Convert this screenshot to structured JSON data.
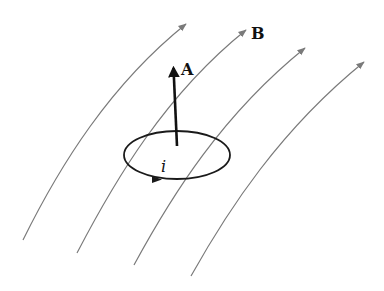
{
  "diagram": {
    "labels": {
      "field": "B",
      "area_vector": "A",
      "current": "i"
    },
    "colors": {
      "field_lines": "#7a7a7a",
      "loop": "#1a1a1a",
      "vector": "#111111",
      "background": "#ffffff"
    },
    "field_lines": [
      {
        "id": 1,
        "start": [
          23,
          240
        ],
        "end": [
          186,
          24
        ]
      },
      {
        "id": 2,
        "start": [
          77,
          253
        ],
        "end": [
          246,
          30
        ]
      },
      {
        "id": 3,
        "start": [
          134,
          265
        ],
        "end": [
          305,
          48
        ]
      },
      {
        "id": 4,
        "start": [
          191,
          276
        ],
        "end": [
          364,
          62
        ]
      }
    ],
    "loop": {
      "cx": 177,
      "cy": 155,
      "rx": 53,
      "ry": 24
    },
    "vector_A": {
      "from": [
        177,
        146
      ],
      "to": [
        173,
        62
      ]
    }
  }
}
